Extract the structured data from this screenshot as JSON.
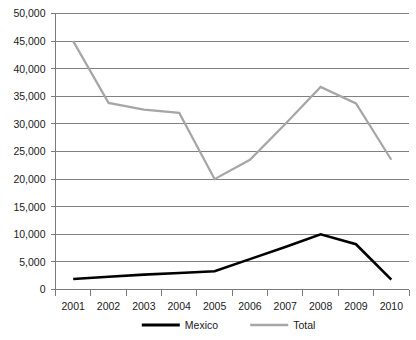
{
  "chart_data": {
    "type": "line",
    "title": "",
    "xlabel": "",
    "ylabel": "",
    "grid": true,
    "legend_position": "bottom",
    "categories": [
      "2001",
      "2002",
      "2003",
      "2004",
      "2005",
      "2006",
      "2007",
      "2008",
      "2009",
      "2010"
    ],
    "x": [
      2001,
      2002,
      2003,
      2004,
      2005,
      2006,
      2007,
      2008,
      2009,
      2010
    ],
    "ylim": [
      0,
      50000
    ],
    "ytick_values": [
      0,
      5000,
      10000,
      15000,
      20000,
      25000,
      30000,
      35000,
      40000,
      45000,
      50000
    ],
    "ytick_labels": [
      "0",
      "5,000",
      "10,000",
      "15,000",
      "20,000",
      "25,000",
      "30,000",
      "35,000",
      "40,000",
      "45,000",
      "50,000"
    ],
    "series": [
      {
        "name": "Mexico",
        "color": "#000000",
        "values": [
          1900,
          2300,
          2700,
          3000,
          3300,
          5500,
          7700,
          10000,
          8200,
          1800
        ]
      },
      {
        "name": "Total",
        "color": "#a6a6a6",
        "values": [
          45000,
          33800,
          32600,
          32000,
          20000,
          23500,
          30000,
          36700,
          33700,
          23500
        ]
      }
    ]
  },
  "legend": {
    "items": [
      {
        "label": "Mexico",
        "color": "#000000"
      },
      {
        "label": "Total",
        "color": "#a6a6a6"
      }
    ]
  },
  "artifact": {
    "clipped_text": "                                                                                     "
  }
}
